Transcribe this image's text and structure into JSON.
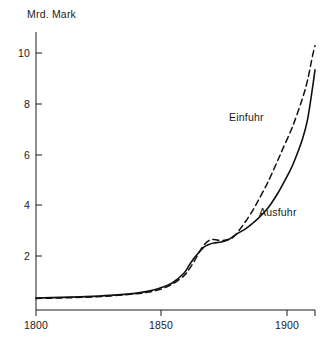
{
  "chart_data": {
    "type": "line",
    "title": "",
    "subtitle": "",
    "xlabel": "",
    "ylabel": "Mrd. Mark",
    "unit_label": "Mrd. Mark",
    "xlim": [
      1800,
      1913
    ],
    "ylim": [
      0,
      10.7
    ],
    "grid": false,
    "legend_position": "inline-annotation",
    "xticks": [
      1800,
      1850,
      1900
    ],
    "xtick_labels": [
      "1800",
      "1850",
      "1900"
    ],
    "yticks": [
      2,
      4,
      6,
      8,
      10
    ],
    "ytick_labels": [
      "2",
      "4",
      "6",
      "8",
      "10"
    ],
    "x": [
      1800,
      1810,
      1820,
      1830,
      1840,
      1845,
      1850,
      1855,
      1860,
      1862,
      1864,
      1866,
      1868,
      1870,
      1872,
      1875,
      1878,
      1880,
      1882,
      1885,
      1888,
      1890,
      1893,
      1895,
      1898,
      1900,
      1903,
      1905,
      1908,
      1910,
      1912,
      1913
    ],
    "series": [
      {
        "name": "Einfuhr",
        "style": "dashed",
        "color": "#111111",
        "label_x": 1888,
        "label_y": 7.4,
        "values": [
          0.4,
          0.42,
          0.45,
          0.5,
          0.58,
          0.64,
          0.75,
          0.95,
          1.3,
          1.55,
          1.85,
          2.2,
          2.5,
          2.68,
          2.72,
          2.68,
          2.72,
          2.82,
          3.05,
          3.45,
          3.9,
          4.25,
          4.8,
          5.2,
          5.85,
          6.3,
          6.95,
          7.45,
          8.3,
          9.0,
          9.95,
          10.35
        ]
      },
      {
        "name": "Ausfuhr",
        "style": "solid",
        "color": "#111111",
        "label_x": 1899,
        "label_y": 3.85,
        "values": [
          0.42,
          0.44,
          0.47,
          0.52,
          0.6,
          0.68,
          0.8,
          1.0,
          1.4,
          1.7,
          1.98,
          2.22,
          2.42,
          2.52,
          2.58,
          2.62,
          2.72,
          2.85,
          2.98,
          3.15,
          3.38,
          3.55,
          3.85,
          4.1,
          4.55,
          4.9,
          5.45,
          5.9,
          6.7,
          7.45,
          8.7,
          9.4
        ]
      }
    ]
  },
  "axes": {
    "unit_label": "Mrd. Mark"
  }
}
